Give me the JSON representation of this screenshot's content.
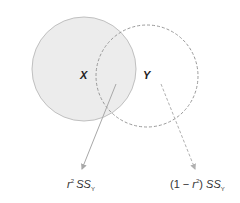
{
  "diagram": {
    "circles": [
      {
        "id": "x",
        "label": "X",
        "cx": 84,
        "cy": 69,
        "r": 52,
        "style": "solid",
        "fill": "#ececec",
        "stroke": "#bdbdbd"
      },
      {
        "id": "y",
        "label": "Y",
        "cx": 147,
        "cy": 76,
        "r": 51,
        "style": "dashed",
        "fill": "none",
        "stroke": "#9a9a9a"
      }
    ],
    "arrows": [
      {
        "from": [
          116,
          84
        ],
        "to": [
          82,
          170
        ],
        "style": "solid",
        "color": "#a8a8a8"
      },
      {
        "from": [
          161,
          84
        ],
        "to": [
          195,
          170
        ],
        "style": "dashed",
        "color": "#b0b0b0"
      }
    ],
    "captions": {
      "explained": {
        "base": "r",
        "sup": "2",
        "ss": "SS",
        "sub": "Y"
      },
      "unexplained": {
        "prefix": "(1 − ",
        "base": "r",
        "sup": "2",
        "suffix": ") ",
        "ss": "SS",
        "sub": "Y"
      }
    }
  }
}
